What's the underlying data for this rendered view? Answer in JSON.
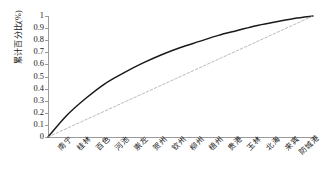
{
  "chart_data": {
    "type": "line",
    "title": "",
    "xlabel": "",
    "ylabel": "累计百分比(%)",
    "categories": [
      "南宁",
      "桂林",
      "百色",
      "河池",
      "崇左",
      "贺州",
      "钦州",
      "柳州",
      "梧州",
      "贵港",
      "玉林",
      "北海",
      "来宾",
      "防城港"
    ],
    "ylim": [
      0,
      1
    ],
    "ytick_labels": [
      "0",
      "0.1",
      "0.2",
      "0.3",
      "0.4",
      "0.5",
      "0.6",
      "0.7",
      "0.8",
      "0.9",
      "1"
    ],
    "ytick_values": [
      0,
      0.1,
      0.2,
      0.3,
      0.4,
      0.5,
      0.6,
      0.7,
      0.8,
      0.9,
      1
    ],
    "grid": false,
    "legend_position": "none",
    "origin_value": 0,
    "series": [
      {
        "name": "累计百分比",
        "style": "solid",
        "color": "#1a1a1a",
        "values": [
          0.18,
          0.32,
          0.44,
          0.53,
          0.61,
          0.68,
          0.74,
          0.79,
          0.84,
          0.88,
          0.92,
          0.95,
          0.98,
          1.0
        ]
      },
      {
        "name": "均等参考线",
        "style": "dashed",
        "color": "#a8a8a8",
        "values": [
          0.0714,
          0.1429,
          0.2143,
          0.2857,
          0.3571,
          0.4286,
          0.5,
          0.5714,
          0.6429,
          0.7143,
          0.7857,
          0.8571,
          0.9286,
          1.0
        ]
      }
    ]
  }
}
